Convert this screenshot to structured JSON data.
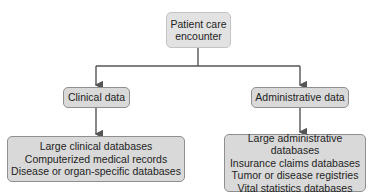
{
  "diagram": {
    "root": {
      "label_line1": "Patient care",
      "label_line2": "encounter"
    },
    "branches": [
      {
        "label": "Clinical data",
        "sources": [
          "Large clinical databases",
          "Computerized medical records",
          "Disease or organ-specific databases"
        ]
      },
      {
        "label": "Administrative data",
        "sources": [
          "Large administrative databases",
          "Insurance claims databases",
          "Tumor or disease registries",
          "Vital statistics databases"
        ]
      }
    ],
    "colors": {
      "box_fill": "#d9d9d9",
      "box_border": "#8f8f8f",
      "connector": "#555555"
    }
  }
}
